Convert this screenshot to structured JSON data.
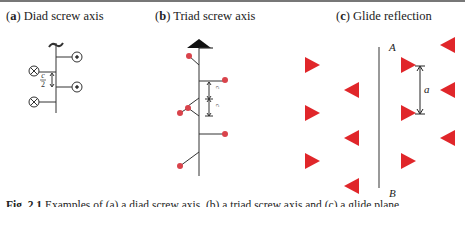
{
  "panels": [
    {
      "letter": "a",
      "title": "Diad screw axis",
      "paren_open": "(",
      "paren_close": ")"
    },
    {
      "letter": "b",
      "title": "Triad screw axis",
      "paren_open": "(",
      "paren_close": ")"
    },
    {
      "letter": "c",
      "title": "Glide reflection",
      "paren_open": "(",
      "paren_close": ")"
    }
  ],
  "diad": {
    "spacing_label_num": "c",
    "spacing_label_den": "2",
    "symbols": [
      "cross-in-circle",
      "dot-in-circle"
    ]
  },
  "triad": {
    "spacing_label_num": "c",
    "spacing_label_den": "3",
    "atom_color": "#d9434b"
  },
  "glide": {
    "line_top_label": "A",
    "line_bottom_label": "B",
    "translation_label": "a",
    "triangle_color": "#e0262a"
  },
  "caption": {
    "fig_label": "Fig. 2.1",
    "text": " Examples of (a) a diad screw axis, (b) a triad screw axis and (c) a glide plane"
  }
}
